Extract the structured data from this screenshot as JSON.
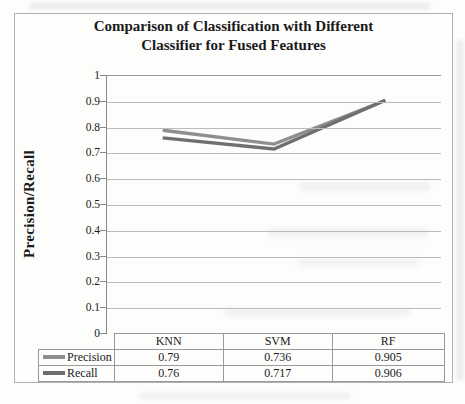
{
  "figure": {
    "title_line1": "Comparison of Classification with Different",
    "title_line2": "Classifier for Fused Features",
    "y_axis_label": "Precision/Recall"
  },
  "chart_data": {
    "type": "line",
    "title": "Comparison of Classification with Different Classifier for Fused Features",
    "xlabel": "",
    "ylabel": "Precision/Recall",
    "categories": [
      "KNN",
      "SVM",
      "RF"
    ],
    "series": [
      {
        "name": "Precision",
        "values": [
          0.79,
          0.736,
          0.905
        ],
        "labels": [
          "0.79",
          "0.736",
          "0.905"
        ],
        "color": "#8f8f8f"
      },
      {
        "name": "Recall",
        "values": [
          0.76,
          0.717,
          0.906
        ],
        "labels": [
          "0.76",
          "0.717",
          "0.906"
        ],
        "color": "#6f6f6f"
      }
    ],
    "ylim": [
      0,
      1
    ],
    "yticks": [
      {
        "value": 1,
        "label": "1"
      },
      {
        "value": 0.9,
        "label": "0.9"
      },
      {
        "value": 0.8,
        "label": "0.8"
      },
      {
        "value": 0.7,
        "label": "0.7"
      },
      {
        "value": 0.6,
        "label": "0.6"
      },
      {
        "value": 0.5,
        "label": "0.5"
      },
      {
        "value": 0.4,
        "label": "0.4"
      },
      {
        "value": 0.3,
        "label": "0.3"
      },
      {
        "value": 0.2,
        "label": "0.2"
      },
      {
        "value": 0.1,
        "label": "0.1"
      },
      {
        "value": 0,
        "label": "0"
      }
    ],
    "grid": true,
    "legend_position": "data-table-left-column"
  }
}
